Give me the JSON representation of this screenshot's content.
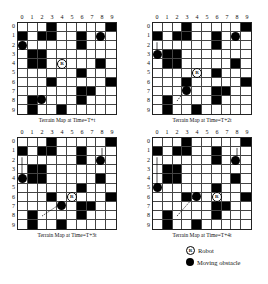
{
  "columns": [
    "0",
    "1",
    "2",
    "3",
    "4",
    "5",
    "6",
    "7",
    "8",
    "9"
  ],
  "rows": [
    "0",
    "1",
    "2",
    "3",
    "4",
    "5",
    "6",
    "7",
    "8",
    "9"
  ],
  "static_obstacles": [
    [
      0,
      3
    ],
    [
      0,
      9
    ],
    [
      1,
      0
    ],
    [
      1,
      2
    ],
    [
      1,
      3
    ],
    [
      1,
      6
    ],
    [
      2,
      6
    ],
    [
      3,
      1
    ],
    [
      3,
      2
    ],
    [
      4,
      1
    ],
    [
      4,
      2
    ],
    [
      4,
      8
    ],
    [
      5,
      6
    ],
    [
      6,
      3
    ],
    [
      6,
      9
    ],
    [
      7,
      6
    ],
    [
      7,
      7
    ],
    [
      8,
      1
    ],
    [
      8,
      6
    ],
    [
      9,
      1
    ],
    [
      9,
      4
    ]
  ],
  "panels": [
    {
      "caption": "Terrain Map at Time=T+t",
      "robot": [
        4,
        4
      ],
      "movers": [
        [
          1,
          8
        ],
        [
          2,
          0
        ],
        [
          8,
          2
        ]
      ],
      "arrows": []
    },
    {
      "caption": "Terrain Map at Time=T+2t",
      "robot": [
        5,
        4
      ],
      "movers": [
        [
          1,
          8
        ],
        [
          3,
          0
        ],
        [
          7,
          3
        ]
      ],
      "arrows": [
        {
          "type": "solid",
          "from": [
            2,
            0
          ],
          "to": [
            3,
            0
          ]
        },
        {
          "type": "dashed",
          "from": [
            8,
            2
          ],
          "to": [
            7,
            3
          ]
        }
      ]
    },
    {
      "caption": "Terrain Map at Time=T+3t",
      "robot": [
        6,
        5
      ],
      "movers": [
        [
          2,
          8
        ],
        [
          4,
          0
        ],
        [
          7,
          4
        ]
      ],
      "arrows": [
        {
          "type": "solid",
          "from": [
            2,
            0
          ],
          "to": [
            4,
            0
          ]
        },
        {
          "type": "solid",
          "from": [
            1,
            8
          ],
          "to": [
            2,
            8
          ]
        },
        {
          "type": "dashed",
          "from": [
            8,
            2
          ],
          "to": [
            7,
            4
          ]
        }
      ]
    },
    {
      "caption": "Terrain Map at Time=T+4t",
      "robot": [
        6,
        6
      ],
      "movers": [
        [
          2,
          8
        ],
        [
          5,
          0
        ],
        [
          6,
          4
        ]
      ],
      "arrows": [
        {
          "type": "solid",
          "from": [
            2,
            0
          ],
          "to": [
            5,
            0
          ]
        },
        {
          "type": "solid",
          "from": [
            1,
            8
          ],
          "to": [
            2,
            8
          ]
        },
        {
          "type": "dashed",
          "from": [
            8,
            2
          ],
          "to": [
            6,
            4
          ]
        }
      ]
    }
  ],
  "legend": {
    "robot_symbol": "R",
    "robot_label": "Robot",
    "mover_label": "Moving obstacle"
  }
}
